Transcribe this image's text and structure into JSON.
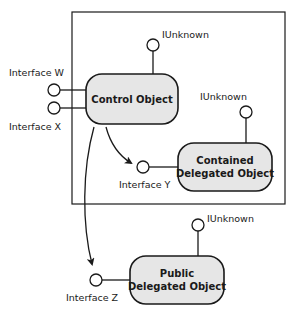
{
  "diagram": {
    "type": "COM aggregation / delegation diagram",
    "colors": {
      "stroke": "#1a1a1a",
      "object_fill": "#e6e6e6",
      "background": "#ffffff"
    },
    "objects": {
      "control": {
        "label": "Control Object"
      },
      "contained": {
        "line1": "Contained",
        "line2": "Delegated Object"
      },
      "public": {
        "line1": "Public",
        "line2": "Delegated Object"
      }
    },
    "interfaces": {
      "w": "Interface W",
      "x": "Interface X",
      "y": "Interface Y",
      "z": "Interface Z",
      "control_iunknown": "IUnknown",
      "contained_iunknown": "IUnknown",
      "public_iunknown": "IUnknown"
    },
    "edges": [
      {
        "from": "Control Object",
        "to": "Interface Y",
        "arrow": true
      },
      {
        "from": "Control Object",
        "to": "Interface Z",
        "arrow": true
      }
    ]
  }
}
